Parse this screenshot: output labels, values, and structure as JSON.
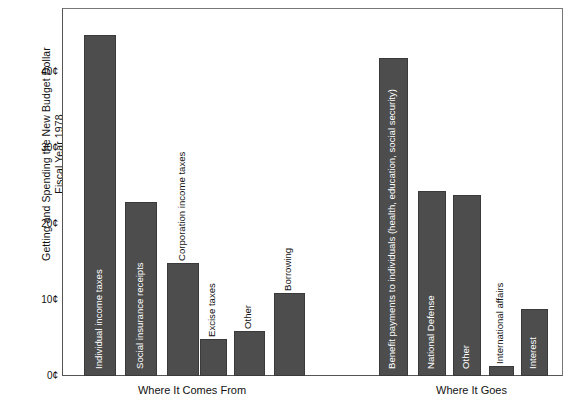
{
  "chart_data": {
    "type": "bar",
    "title": "Getting and Spending the New Budget Dollar Fiscal Year 1978",
    "title_line1": "Getting and Spending the New Budget Dollar",
    "title_line2": "Fiscal Year 1978",
    "xlabel": "",
    "ylabel": "Getting and Spending the New Budget Dollar Fiscal Year 1978",
    "ylim": [
      0,
      46
    ],
    "grid": false,
    "legend": "none",
    "bar_color": "#4d4d4d",
    "yticks": [
      {
        "value": 0,
        "label": "0¢"
      },
      {
        "value": 10,
        "label": "10¢"
      },
      {
        "value": 20,
        "label": "20¢"
      },
      {
        "value": 30,
        "label": "30¢"
      },
      {
        "value": 40,
        "label": "40¢"
      }
    ],
    "groups": [
      {
        "caption": "Where It Comes From",
        "categories": [
          "Individual income taxes",
          "Social insurance receipts",
          "Corporation income taxes",
          "Excise taxes",
          "Other",
          "Borrowing"
        ],
        "values": [
          45,
          23,
          15,
          5,
          6,
          11
        ]
      },
      {
        "caption": "Where It Goes",
        "categories": [
          "Benefit payments to individuals (health, education, social security)",
          "National Defense",
          "Other",
          "International affairs",
          "Interest"
        ],
        "values": [
          42,
          24.5,
          24,
          1.5,
          9
        ]
      }
    ]
  },
  "bars": [
    {
      "label": "Individual income taxes",
      "value": 45,
      "group": 0,
      "label_inside": true
    },
    {
      "label": "Social insurance receipts",
      "value": 23,
      "group": 0,
      "label_inside": true
    },
    {
      "label": "Corporation income taxes",
      "value": 15,
      "group": 0,
      "label_inside": false
    },
    {
      "label": "Excise taxes",
      "value": 5,
      "group": 0,
      "label_inside": false
    },
    {
      "label": "Other",
      "value": 6,
      "group": 0,
      "label_inside": false
    },
    {
      "label": "Borrowing",
      "value": 11,
      "group": 0,
      "label_inside": false
    },
    {
      "label": "Benefit payments to individuals (health, education, social security)",
      "value": 42,
      "group": 1,
      "label_inside": true
    },
    {
      "label": "National Defense",
      "value": 24.5,
      "group": 1,
      "label_inside": true
    },
    {
      "label": "Other",
      "value": 24,
      "group": 1,
      "label_inside": true
    },
    {
      "label": "International affairs",
      "value": 1.5,
      "group": 1,
      "label_inside": false
    },
    {
      "label": "Interest",
      "value": 9,
      "group": 1,
      "label_inside": true
    }
  ],
  "captions": {
    "left": "Where It Comes From",
    "right": "Where It Goes"
  }
}
